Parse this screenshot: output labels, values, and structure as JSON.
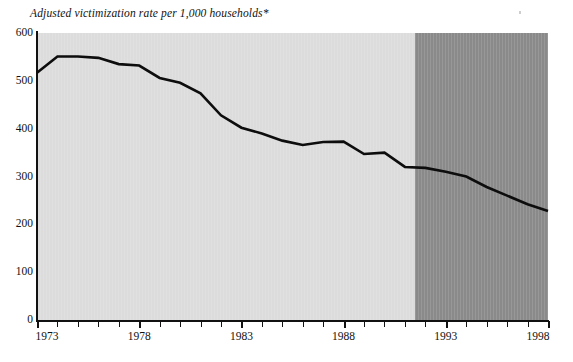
{
  "chart_data": {
    "type": "line",
    "title": "Adjusted victimization rate per 1,000 households*",
    "xlabel": "",
    "ylabel": "",
    "xlim": [
      1973,
      1998
    ],
    "ylim": [
      0,
      600
    ],
    "grid": false,
    "legend": null,
    "y_ticks": [
      0,
      100,
      200,
      300,
      400,
      500,
      600
    ],
    "y_tick_labels": [
      "0",
      "100",
      "200",
      "300",
      "400",
      "500",
      "600"
    ],
    "x_ticks": [
      1973,
      1974,
      1975,
      1976,
      1977,
      1978,
      1979,
      1980,
      1981,
      1982,
      1983,
      1984,
      1985,
      1986,
      1987,
      1988,
      1989,
      1990,
      1991,
      1992,
      1993,
      1994,
      1995,
      1996,
      1997,
      1998
    ],
    "x_tick_labels_shown": [
      "1973",
      "1978",
      "1983",
      "1988",
      "1993",
      "1998"
    ],
    "x": [
      1973,
      1974,
      1975,
      1976,
      1977,
      1978,
      1979,
      1980,
      1981,
      1982,
      1983,
      1984,
      1985,
      1986,
      1987,
      1988,
      1989,
      1990,
      1991,
      1992,
      1993,
      1994,
      1995,
      1996,
      1997,
      1998
    ],
    "values": [
      517,
      551,
      551,
      548,
      535,
      532,
      506,
      496,
      474,
      428,
      402,
      390,
      375,
      366,
      372,
      373,
      347,
      350,
      320,
      318,
      310,
      300,
      278,
      260,
      242,
      228
    ],
    "series": [
      {
        "name": "Adjusted victimization rate per 1,000 households",
        "values": [
          517,
          551,
          551,
          548,
          535,
          532,
          506,
          496,
          474,
          428,
          402,
          390,
          375,
          366,
          372,
          373,
          347,
          350,
          320,
          318,
          310,
          300,
          278,
          260,
          242,
          228
        ],
        "color": "#0d0d0d"
      }
    ],
    "shaded_regions": [
      {
        "name": "light-band",
        "from": 1973,
        "to": 1991.5,
        "color": "#dcdcdc"
      },
      {
        "name": "dark-band",
        "from": 1991.5,
        "to": 1998,
        "color": "#8a8a8a"
      }
    ],
    "annotations": []
  },
  "footnote": {
    "text": ""
  }
}
